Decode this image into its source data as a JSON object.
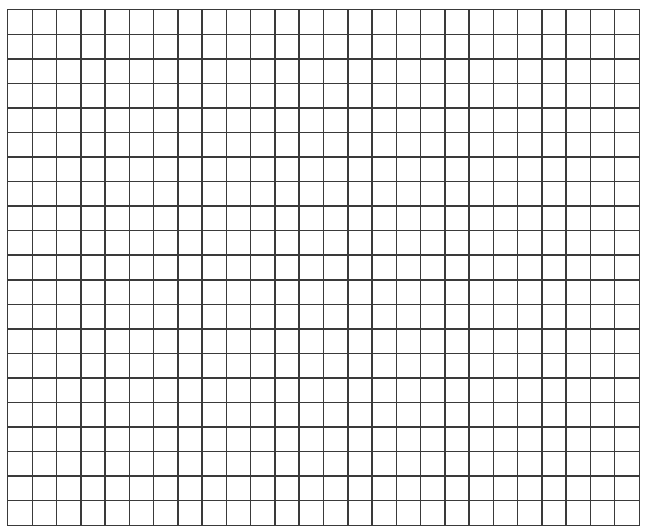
{
  "grid": {
    "columns": 26,
    "rows": 21,
    "line_color": "#3a3a3a",
    "background_color": "#ffffff"
  }
}
